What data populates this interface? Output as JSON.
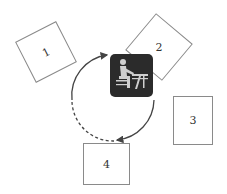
{
  "diagram": {
    "central_icon": "person-at-desk-icon",
    "stations": [
      {
        "label": "1"
      },
      {
        "label": "2"
      },
      {
        "label": "3"
      },
      {
        "label": "4"
      }
    ],
    "colors": {
      "icon_bg": "#2b2b2b",
      "icon_fg": "#cfcfcf",
      "box_border": "#8a8a8a",
      "arrow": "#444444"
    }
  }
}
